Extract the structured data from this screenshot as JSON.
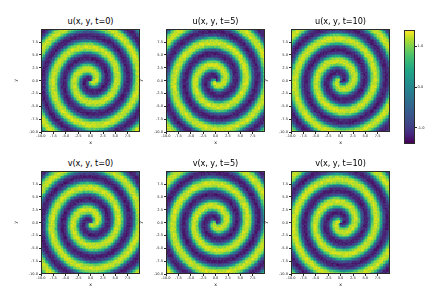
{
  "figure": {
    "colormap": "viridis",
    "background": "#ffffff",
    "rows": 2,
    "cols": 3
  },
  "axis": {
    "xlabel": "x",
    "ylabel": "y",
    "xlim": [
      -10.0,
      10.0
    ],
    "ylim": [
      -10.0,
      10.0
    ],
    "xticks": [
      "-10.0",
      "-7.5",
      "-5.0",
      "-2.5",
      "0.0",
      "2.5",
      "5.0",
      "7.5"
    ],
    "xtick_values": [
      -10.0,
      -7.5,
      -5.0,
      -2.5,
      0.0,
      2.5,
      5.0,
      7.5
    ],
    "yticks": [
      "7.5",
      "5.0",
      "2.5",
      "0.0",
      "-2.5",
      "-5.0",
      "-7.5",
      "-10.0"
    ],
    "ytick_values": [
      7.5,
      5.0,
      2.5,
      0.0,
      -2.5,
      -5.0,
      -7.5,
      -10.0
    ]
  },
  "colorbar": {
    "ticks": [
      "1.0",
      "0.0",
      "-1.0"
    ],
    "tick_values": [
      1.0,
      0.0,
      -1.0
    ],
    "vmin": -1.4,
    "vmax": 1.4,
    "orientation": "vertical"
  },
  "panels": [
    {
      "title": "u(x, y, t=0)",
      "field": "u",
      "time": 0,
      "phase": 0.0
    },
    {
      "title": "u(x, y, t=5)",
      "field": "u",
      "time": 5,
      "phase": 1.15
    },
    {
      "title": "u(x, y, t=10)",
      "field": "u",
      "time": 10,
      "phase": 2.3
    },
    {
      "title": "v(x, y, t=0)",
      "field": "v",
      "time": 0,
      "phase": 0.35
    },
    {
      "title": "v(x, y, t=5)",
      "field": "v",
      "time": 5,
      "phase": 1.5
    },
    {
      "title": "v(x, y, t=10)",
      "field": "v",
      "time": 10,
      "phase": 2.65
    }
  ],
  "chart_data": {
    "type": "heatmap",
    "title": "",
    "xlabel": "x",
    "ylabel": "y",
    "xlim": [
      -10.0,
      10.0
    ],
    "ylim": [
      -10.0,
      10.0
    ],
    "colormap": "viridis",
    "colorbar_range": [
      -1.4,
      1.4
    ],
    "colorbar_ticks": [
      1.0,
      0.0,
      -1.0
    ],
    "grid": false,
    "legend": "none",
    "panels": [
      {
        "title": "u(x, y, t=0)",
        "field": "u",
        "time": 0,
        "pattern": "archimedean-spiral",
        "arms": 1,
        "wavelength": 4.4,
        "phase": 0.0,
        "noise": 0.18,
        "center": [
          0.0,
          0.0
        ]
      },
      {
        "title": "u(x, y, t=5)",
        "field": "u",
        "time": 5,
        "pattern": "archimedean-spiral",
        "arms": 1,
        "wavelength": 4.4,
        "phase": 1.15,
        "noise": 0.18,
        "center": [
          0.0,
          0.0
        ]
      },
      {
        "title": "u(x, y, t=10)",
        "field": "u",
        "time": 10,
        "pattern": "archimedean-spiral",
        "arms": 1,
        "wavelength": 4.4,
        "phase": 2.3,
        "noise": 0.18,
        "center": [
          0.0,
          0.0
        ]
      },
      {
        "title": "v(x, y, t=0)",
        "field": "v",
        "time": 0,
        "pattern": "archimedean-spiral",
        "arms": 1,
        "wavelength": 4.4,
        "phase": 0.35,
        "noise": 0.18,
        "center": [
          0.0,
          0.0
        ]
      },
      {
        "title": "v(x, y, t=5)",
        "field": "v",
        "time": 5,
        "pattern": "archimedean-spiral",
        "arms": 1,
        "wavelength": 4.4,
        "phase": 1.5,
        "noise": 0.18,
        "center": [
          0.0,
          0.0
        ]
      },
      {
        "title": "v(x, y, t=10)",
        "field": "v",
        "time": 10,
        "pattern": "archimedean-spiral",
        "arms": 1,
        "wavelength": 4.4,
        "phase": 2.65,
        "noise": 0.18,
        "center": [
          0.0,
          0.0
        ]
      }
    ]
  }
}
